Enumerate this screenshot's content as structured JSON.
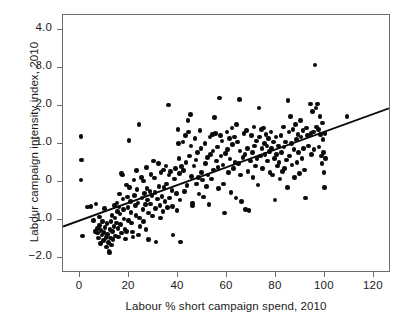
{
  "figure": {
    "caption_remnant": "",
    "background": "#ffffff",
    "point_color": "#0a0a0a",
    "axis_color": "#6d6d6d",
    "text_color": "#1b1b1b"
  },
  "chart_data": {
    "type": "scatter",
    "title": "",
    "xlabel": "Labour % short campaign spend, 2010",
    "ylabel": "Labour campaign intensity index, 2010",
    "xlim": [
      -7,
      127
    ],
    "ylim": [
      -2.4,
      4.4
    ],
    "xticks": [
      0,
      20,
      40,
      60,
      80,
      100,
      120
    ],
    "xticklabels": [
      "0",
      "20",
      "40",
      "60",
      "80",
      "100",
      "120"
    ],
    "yticks": [
      4.0,
      3.0,
      2.0,
      1.0,
      0,
      -1.0,
      -2.0
    ],
    "yticklabels": [
      "4.0",
      "3.0",
      "2.0",
      "1.0",
      "0",
      "−1.0",
      "−2.0"
    ],
    "grid": false,
    "legend": null,
    "marker": "circle",
    "marker_size": 4.6,
    "trendline": {
      "type": "linear",
      "x_start": -7,
      "y_start": -1.22,
      "x_end": 127,
      "y_end": 1.92,
      "slope": 0.0234,
      "intercept": -1.056,
      "color": "#0a0a0a",
      "width": 1.9
    },
    "n_points": 284,
    "points": [
      [
        0.3,
        1.2
      ],
      [
        0.5,
        0.58
      ],
      [
        0.4,
        0.05
      ],
      [
        1.0,
        -1.42
      ],
      [
        3.0,
        -0.66
      ],
      [
        4.5,
        -0.64
      ],
      [
        5.5,
        -1.02
      ],
      [
        6.0,
        -1.3
      ],
      [
        6.5,
        -0.58
      ],
      [
        7.0,
        -1.22
      ],
      [
        7.2,
        -1.35
      ],
      [
        7.5,
        -1.48
      ],
      [
        7.8,
        -1.15
      ],
      [
        8.0,
        -0.92
      ],
      [
        8.3,
        -1.62
      ],
      [
        8.6,
        -1.28
      ],
      [
        9.0,
        -1.4
      ],
      [
        9.2,
        -1.05
      ],
      [
        9.5,
        -1.55
      ],
      [
        9.8,
        -1.33
      ],
      [
        10.0,
        -0.7
      ],
      [
        10.2,
        -1.2
      ],
      [
        10.5,
        -1.47
      ],
      [
        10.8,
        -1.72
      ],
      [
        11.0,
        -1.1
      ],
      [
        11.2,
        -1.38
      ],
      [
        11.5,
        -1.6
      ],
      [
        11.8,
        -1.82
      ],
      [
        12.0,
        -1.86
      ],
      [
        12.2,
        -1.25
      ],
      [
        12.4,
        -1.48
      ],
      [
        12.6,
        -1.05
      ],
      [
        12.8,
        -1.66
      ],
      [
        13.0,
        -0.88
      ],
      [
        13.2,
        -1.3
      ],
      [
        13.5,
        -1.52
      ],
      [
        13.8,
        -1.18
      ],
      [
        14.0,
        -0.62
      ],
      [
        14.2,
        -0.95
      ],
      [
        14.5,
        -1.42
      ],
      [
        14.8,
        -1.08
      ],
      [
        15.0,
        -0.55
      ],
      [
        15.2,
        -0.78
      ],
      [
        15.4,
        -1.22
      ],
      [
        15.6,
        -1.45
      ],
      [
        15.8,
        -0.66
      ],
      [
        16.0,
        -0.32
      ],
      [
        16.3,
        -0.85
      ],
      [
        16.6,
        -1.12
      ],
      [
        16.9,
        -1.35
      ],
      [
        17.0,
        0.22
      ],
      [
        17.2,
        0.18
      ],
      [
        17.5,
        -0.45
      ],
      [
        17.8,
        -0.72
      ],
      [
        18.0,
        -0.98
      ],
      [
        18.3,
        -1.25
      ],
      [
        18.6,
        -1.5
      ],
      [
        18.9,
        -1.3
      ],
      [
        19.0,
        -0.08
      ],
      [
        19.3,
        -0.4
      ],
      [
        19.6,
        -0.68
      ],
      [
        19.8,
        -1.02
      ],
      [
        20.0,
        1.1
      ],
      [
        20.2,
        -0.15
      ],
      [
        20.5,
        -0.52
      ],
      [
        20.8,
        -0.8
      ],
      [
        21.0,
        -1.08
      ],
      [
        21.3,
        -1.32
      ],
      [
        21.6,
        -1.45
      ],
      [
        22.0,
        0.05
      ],
      [
        22.3,
        -0.35
      ],
      [
        22.6,
        -0.62
      ],
      [
        22.9,
        -0.88
      ],
      [
        23.0,
        0.3
      ],
      [
        23.3,
        -0.2
      ],
      [
        23.6,
        -0.55
      ],
      [
        23.9,
        -1.4
      ],
      [
        24.0,
        1.52
      ],
      [
        24.2,
        -0.95
      ],
      [
        24.5,
        -1.18
      ],
      [
        25.0,
        0.12
      ],
      [
        25.3,
        -0.42
      ],
      [
        25.6,
        -0.72
      ],
      [
        25.9,
        -1.05
      ],
      [
        26.0,
        0.02
      ],
      [
        26.3,
        -0.3
      ],
      [
        26.6,
        -0.6
      ],
      [
        26.9,
        -1.25
      ],
      [
        27.0,
        0.38
      ],
      [
        27.3,
        -0.18
      ],
      [
        27.6,
        -0.48
      ],
      [
        27.9,
        -0.82
      ],
      [
        28.0,
        -1.52
      ],
      [
        28.5,
        -0.25
      ],
      [
        28.8,
        -0.58
      ],
      [
        29.0,
        0.2
      ],
      [
        29.3,
        -0.35
      ],
      [
        29.6,
        -0.9
      ],
      [
        30.0,
        0.55
      ],
      [
        30.3,
        0.1
      ],
      [
        30.6,
        -0.28
      ],
      [
        30.9,
        -0.7
      ],
      [
        31.0,
        -1.58
      ],
      [
        31.5,
        -0.45
      ],
      [
        32.0,
        0.48
      ],
      [
        32.3,
        -0.12
      ],
      [
        32.6,
        -0.62
      ],
      [
        32.9,
        -0.95
      ],
      [
        33.0,
        0.25
      ],
      [
        33.5,
        -0.38
      ],
      [
        33.8,
        -0.78
      ],
      [
        34.0,
        0.32
      ],
      [
        34.3,
        -0.15
      ],
      [
        34.6,
        -0.52
      ],
      [
        35.0,
        0.42
      ],
      [
        35.3,
        -0.05
      ],
      [
        35.6,
        -0.68
      ],
      [
        36.0,
        2.03
      ],
      [
        36.3,
        0.18
      ],
      [
        36.6,
        -0.42
      ],
      [
        37.0,
        0.28
      ],
      [
        37.5,
        -0.22
      ],
      [
        37.8,
        -0.65
      ],
      [
        38.0,
        -1.4
      ],
      [
        38.5,
        0.08
      ],
      [
        39.0,
        0.35
      ],
      [
        39.3,
        -0.3
      ],
      [
        39.6,
        -0.75
      ],
      [
        40.0,
        1.38
      ],
      [
        40.2,
        1.02
      ],
      [
        40.4,
        0.62
      ],
      [
        40.6,
        0.22
      ],
      [
        40.8,
        -0.48
      ],
      [
        41.0,
        -1.58
      ],
      [
        41.5,
        0.4
      ],
      [
        42.0,
        1.05
      ],
      [
        42.3,
        0.3
      ],
      [
        42.6,
        -0.25
      ],
      [
        43.0,
        1.22
      ],
      [
        43.3,
        0.52
      ],
      [
        43.6,
        -0.1
      ],
      [
        44.0,
        1.62
      ],
      [
        44.3,
        1.32
      ],
      [
        44.6,
        0.68
      ],
      [
        45.0,
        1.78
      ],
      [
        45.3,
        0.95
      ],
      [
        45.6,
        0.15
      ],
      [
        45.9,
        -0.55
      ],
      [
        46.0,
        -0.62
      ],
      [
        46.5,
        0.42
      ],
      [
        47.0,
        1.15
      ],
      [
        47.3,
        0.58
      ],
      [
        47.6,
        -0.05
      ],
      [
        48.0,
        0.78
      ],
      [
        48.3,
        0.12
      ],
      [
        48.6,
        -0.32
      ],
      [
        49.0,
        1.35
      ],
      [
        49.3,
        0.88
      ],
      [
        49.6,
        0.25
      ],
      [
        50.0,
        0.05
      ],
      [
        50.5,
        -0.4
      ],
      [
        51.0,
        1.02
      ],
      [
        51.3,
        0.48
      ],
      [
        51.6,
        -0.12
      ],
      [
        52.0,
        0.65
      ],
      [
        52.3,
        0.18
      ],
      [
        52.6,
        -0.6
      ],
      [
        53.0,
        1.18
      ],
      [
        53.3,
        0.72
      ],
      [
        53.6,
        0.08
      ],
      [
        54.0,
        1.25
      ],
      [
        54.3,
        0.82
      ],
      [
        54.6,
        0.32
      ],
      [
        55.0,
        1.7
      ],
      [
        55.3,
        1.28
      ],
      [
        55.6,
        0.55
      ],
      [
        56.0,
        0.92
      ],
      [
        56.3,
        0.38
      ],
      [
        56.6,
        -0.18
      ],
      [
        57.0,
        2.21
      ],
      [
        57.3,
        1.22
      ],
      [
        57.6,
        0.68
      ],
      [
        58.0,
        1.08
      ],
      [
        58.3,
        0.45
      ],
      [
        58.6,
        -0.05
      ],
      [
        59.0,
        -0.82
      ],
      [
        59.5,
        0.75
      ],
      [
        60.0,
        1.32
      ],
      [
        60.3,
        0.85
      ],
      [
        60.6,
        0.25
      ],
      [
        61.0,
        1.15
      ],
      [
        61.3,
        0.6
      ],
      [
        61.6,
        -0.28
      ],
      [
        62.0,
        1.42
      ],
      [
        62.3,
        0.98
      ],
      [
        62.6,
        0.35
      ],
      [
        63.0,
        1.18
      ],
      [
        63.3,
        0.52
      ],
      [
        63.6,
        -0.42
      ],
      [
        64.0,
        1.52
      ],
      [
        64.3,
        1.05
      ],
      [
        64.6,
        0.48
      ],
      [
        65.0,
        2.18
      ],
      [
        65.3,
        0.82
      ],
      [
        65.6,
        0.18
      ],
      [
        66.0,
        -0.52
      ],
      [
        66.5,
        0.65
      ],
      [
        67.0,
        1.28
      ],
      [
        67.3,
        0.72
      ],
      [
        67.6,
        -0.72
      ],
      [
        68.0,
        1.35
      ],
      [
        68.3,
        0.88
      ],
      [
        68.6,
        0.28
      ],
      [
        69.0,
        -0.75
      ],
      [
        69.5,
        0.55
      ],
      [
        70.0,
        1.22
      ],
      [
        70.3,
        0.78
      ],
      [
        70.6,
        0.12
      ],
      [
        71.0,
        1.45
      ],
      [
        71.3,
        0.95
      ],
      [
        71.6,
        0.42
      ],
      [
        72.0,
        1.08
      ],
      [
        72.3,
        0.62
      ],
      [
        72.6,
        -0.08
      ],
      [
        73.0,
        1.95
      ],
      [
        73.3,
        1.18
      ],
      [
        73.6,
        0.68
      ],
      [
        74.0,
        1.38
      ],
      [
        74.3,
        0.88
      ],
      [
        74.6,
        0.35
      ],
      [
        75.0,
        1.42
      ],
      [
        75.3,
        1.02
      ],
      [
        75.6,
        0.72
      ],
      [
        76.0,
        1.25
      ],
      [
        76.3,
        0.95
      ],
      [
        76.6,
        0.55
      ],
      [
        77.0,
        1.15
      ],
      [
        77.3,
        0.8
      ],
      [
        77.6,
        0.25
      ],
      [
        78.0,
        1.32
      ],
      [
        78.3,
        0.88
      ],
      [
        78.6,
        0.18
      ],
      [
        79.0,
        1.05
      ],
      [
        79.3,
        0.62
      ],
      [
        79.6,
        -0.48
      ],
      [
        80.0,
        1.18
      ],
      [
        80.3,
        0.72
      ],
      [
        80.6,
        0.42
      ],
      [
        81.0,
        0.95
      ],
      [
        81.3,
        0.52
      ],
      [
        81.6,
        0.08
      ],
      [
        82.0,
        1.22
      ],
      [
        82.3,
        0.78
      ],
      [
        82.6,
        0.28
      ],
      [
        83.0,
        1.45
      ],
      [
        83.3,
        0.92
      ],
      [
        83.6,
        0.35
      ],
      [
        84.0,
        1.05
      ],
      [
        84.3,
        0.58
      ],
      [
        84.6,
        -0.15
      ],
      [
        85.0,
        2.15
      ],
      [
        85.3,
        1.32
      ],
      [
        85.6,
        0.68
      ],
      [
        86.0,
        1.72
      ],
      [
        86.3,
        1.02
      ],
      [
        86.6,
        0.45
      ],
      [
        87.0,
        1.38
      ],
      [
        87.3,
        0.85
      ],
      [
        87.6,
        0.12
      ],
      [
        88.0,
        1.52
      ],
      [
        88.3,
        1.12
      ],
      [
        88.6,
        0.52
      ],
      [
        89.0,
        1.25
      ],
      [
        89.3,
        0.78
      ],
      [
        89.6,
        0.22
      ],
      [
        90.0,
        1.62
      ],
      [
        90.3,
        1.18
      ],
      [
        90.6,
        0.62
      ],
      [
        91.0,
        1.35
      ],
      [
        91.3,
        0.88
      ],
      [
        91.6,
        0.32
      ],
      [
        92.0,
        -0.42
      ],
      [
        92.5,
        1.42
      ],
      [
        93.0,
        1.22
      ],
      [
        93.3,
        0.95
      ],
      [
        94.0,
        2.05
      ],
      [
        94.3,
        1.28
      ],
      [
        94.6,
        0.72
      ],
      [
        95.0,
        1.85
      ],
      [
        95.3,
        1.32
      ],
      [
        95.6,
        0.85
      ],
      [
        96.0,
        3.08
      ],
      [
        96.3,
        1.95
      ],
      [
        96.6,
        1.45
      ],
      [
        97.0,
        2.05
      ],
      [
        97.3,
        1.38
      ],
      [
        97.6,
        0.92
      ],
      [
        98.0,
        1.72
      ],
      [
        98.3,
        1.25
      ],
      [
        98.6,
        0.68
      ],
      [
        98.8,
        0.48
      ],
      [
        99.0,
        1.55
      ],
      [
        99.2,
        1.12
      ],
      [
        99.4,
        0.78
      ],
      [
        99.6,
        0.25
      ],
      [
        99.8,
        -0.15
      ],
      [
        100.0,
        1.28
      ],
      [
        100.2,
        0.62
      ],
      [
        109.0,
        1.72
      ]
    ]
  }
}
